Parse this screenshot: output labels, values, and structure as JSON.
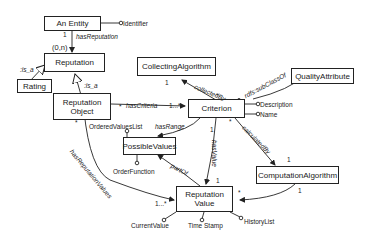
{
  "diagram": {
    "classes": {
      "an_entity": "An Entity",
      "reputation": "Reputation",
      "rating": "Rating",
      "reputation_object_line1": "Reputation",
      "reputation_object_line2": "Object",
      "collecting_algorithm": "CollectingAlgorithm",
      "quality_attribute": "QualityAttribute",
      "criterion": "Criterion",
      "possible_values": "PossibleValues",
      "computation_algorithm": "ComputationAlgorithm",
      "reputation_value_line1": "Reputation",
      "reputation_value_line2": "Value"
    },
    "attributes": {
      "identifier": "Identifier",
      "description": "Description",
      "name": "Name",
      "ordered_values_list": "OrderedValuesList",
      "order_function": "OrderFunction",
      "current_value": "CurrentValue",
      "time_stamp": "Time Stamp",
      "history_list": "HistoryList"
    },
    "relations": {
      "has_reputation": "hasReputation",
      "is_a_rating": ":is_a",
      "is_a_object": ":is_a",
      "has_criteria": "hasCriteria",
      "collected_by": "collectedBy",
      "subclass_of": "rdfs:subClassOf",
      "has_range": "hasRange",
      "has_value": "hasValue",
      "part_of": "partOf",
      "calculated_by": "calculatedBy",
      "has_reputation_values": "hasReputationValues"
    },
    "multiplicities": {
      "entity_side": "1",
      "reputation_side": "(0,n)",
      "criteria_source": "*",
      "criteria_target": "1...*",
      "collecting_target": "1",
      "collecting_source": "*",
      "has_value_target": "1",
      "has_value_source": "1",
      "calculated_source": "*",
      "calculated_target": "1",
      "comp_source": "1",
      "comp_target": "*",
      "rep_values_source": "*",
      "rep_values_target": "1...*"
    }
  }
}
